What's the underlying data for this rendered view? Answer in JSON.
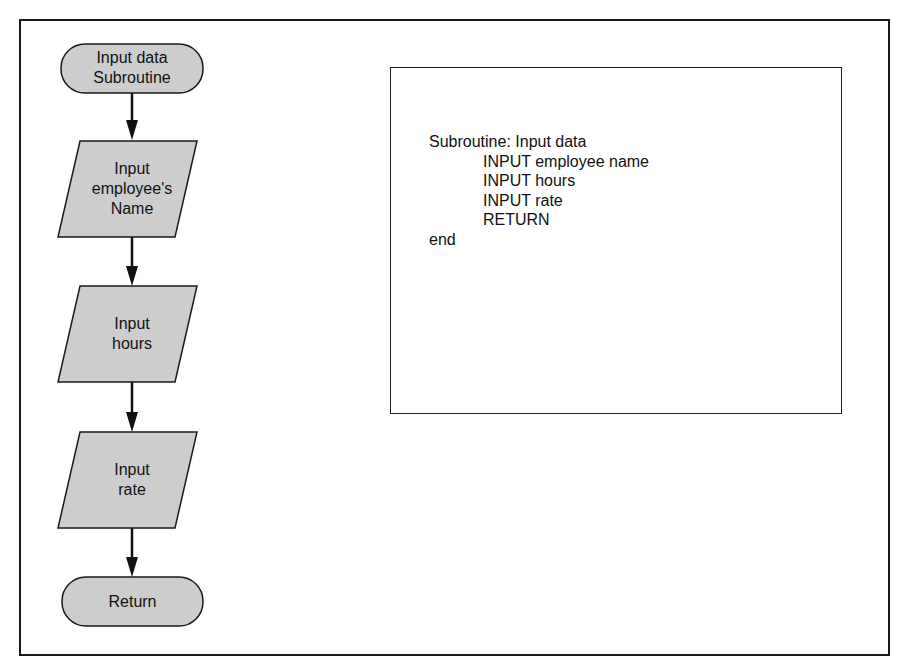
{
  "flowchart": {
    "fill_color": "#cdcdcd",
    "stroke_color": "#1a1a1a",
    "nodes": [
      {
        "id": "start",
        "type": "terminal",
        "label": "Input data\nSubroutine"
      },
      {
        "id": "input-name",
        "type": "input-output",
        "label": "Input\nemployee's\nName"
      },
      {
        "id": "input-hours",
        "type": "input-output",
        "label": "Input\nhours"
      },
      {
        "id": "input-rate",
        "type": "input-output",
        "label": "Input\nrate"
      },
      {
        "id": "return",
        "type": "terminal",
        "label": "Return"
      }
    ],
    "edges": [
      {
        "from": "start",
        "to": "input-name"
      },
      {
        "from": "input-name",
        "to": "input-hours"
      },
      {
        "from": "input-hours",
        "to": "input-rate"
      },
      {
        "from": "input-rate",
        "to": "return"
      }
    ]
  },
  "pseudocode": {
    "lines": [
      {
        "text": "Subroutine: Input data",
        "indent": 0
      },
      {
        "text": "INPUT employee name",
        "indent": 1
      },
      {
        "text": "INPUT hours",
        "indent": 1
      },
      {
        "text": "INPUT rate",
        "indent": 1
      },
      {
        "text": "RETURN",
        "indent": 1
      },
      {
        "text": "end",
        "indent": 0
      }
    ]
  }
}
